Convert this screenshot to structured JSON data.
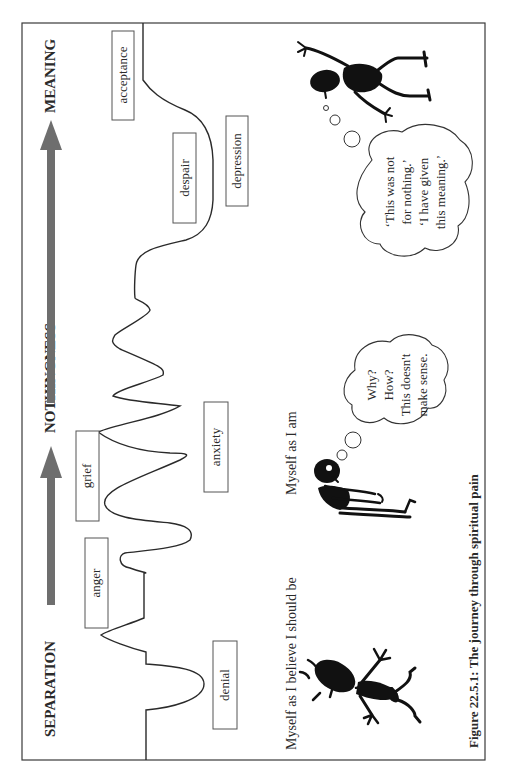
{
  "figure": {
    "caption": "Figure 22.5.1: The journey through spiritual pain",
    "orientation": "rotated 90 degrees counter-clockwise"
  },
  "stages": [
    {
      "label": "SEPARATION"
    },
    {
      "label": "NOTHINGNESS"
    },
    {
      "label": "MEANING"
    }
  ],
  "emotions": [
    {
      "label": "denial"
    },
    {
      "label": "anger"
    },
    {
      "label": "grief"
    },
    {
      "label": "anxiety"
    },
    {
      "label": "despair"
    },
    {
      "label": "depression"
    },
    {
      "label": "acceptance"
    }
  ],
  "figures": [
    {
      "label": "Myself as I believe I should be",
      "thought": []
    },
    {
      "label": "Myself as I am",
      "thought": [
        "Why?",
        "How?",
        "This doesn't",
        "make sense."
      ]
    },
    {
      "label": "",
      "thought": [
        "‘This was not",
        "for nothing.’",
        "‘I have given",
        "this meaning.’"
      ]
    }
  ],
  "colors": {
    "arrow": "#6e6e6e",
    "line": "#2a2a2a",
    "frame": "#3a3a3a",
    "figure_fill": "#111111"
  }
}
